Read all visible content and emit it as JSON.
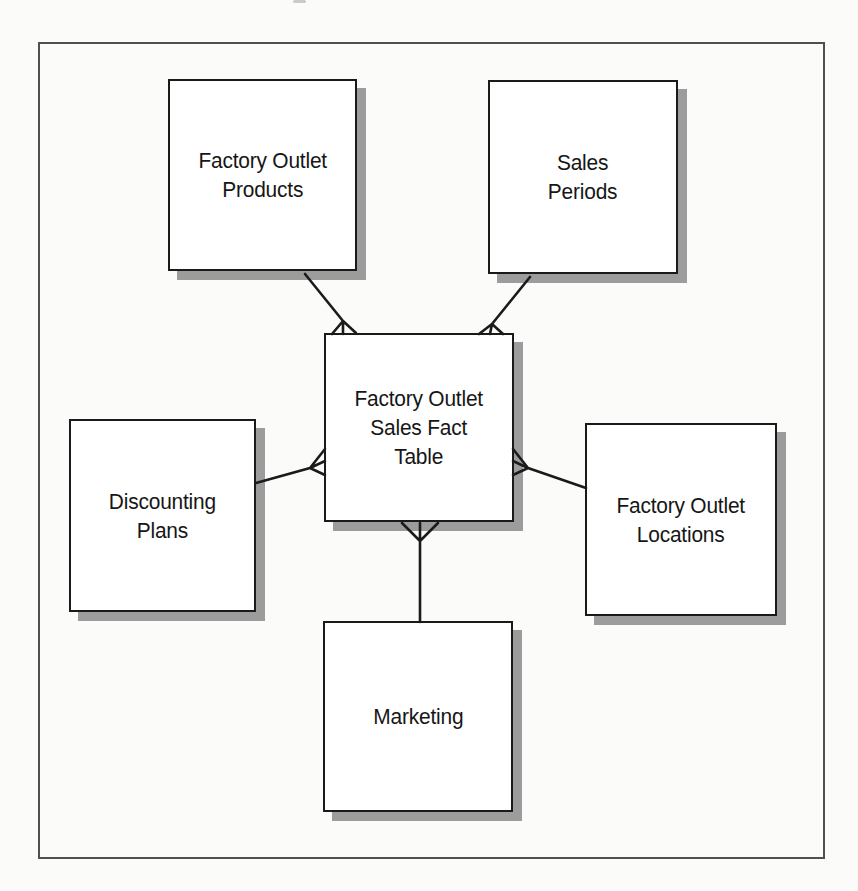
{
  "page": {
    "background": "#fbfbf9",
    "frame_border_color": "#505050"
  },
  "diagram": {
    "kind": "star-schema-entity-diagram",
    "line_color": "#1b1b1b",
    "box_fill": "#ffffff",
    "box_border_color": "#1a1a1a",
    "box_shadow_color": "#9c9c9c",
    "nodes": {
      "products": {
        "label": "Factory Outlet\nProducts"
      },
      "sales_periods": {
        "label": "Sales\nPeriods"
      },
      "fact": {
        "label": "Factory Outlet\nSales Fact\nTable"
      },
      "discounting": {
        "label": "Discounting\nPlans"
      },
      "locations": {
        "label": "Factory Outlet\nLocations"
      },
      "marketing": {
        "label": "Marketing"
      }
    },
    "relationships": [
      {
        "from": "Factory Outlet Products",
        "to": "Factory Outlet Sales Fact Table",
        "crow_foot_at": "fact-table-end"
      },
      {
        "from": "Sales Periods",
        "to": "Factory Outlet Sales Fact Table",
        "crow_foot_at": "fact-table-end"
      },
      {
        "from": "Discounting Plans",
        "to": "Factory Outlet Sales Fact Table",
        "crow_foot_at": "fact-table-end"
      },
      {
        "from": "Factory Outlet Locations",
        "to": "Factory Outlet Sales Fact Table",
        "crow_foot_at": "fact-table-end"
      },
      {
        "from": "Marketing",
        "to": "Factory Outlet Sales Fact Table",
        "crow_foot_at": "fact-table-end"
      }
    ]
  }
}
